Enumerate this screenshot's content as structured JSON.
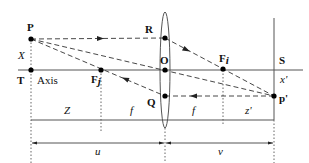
{
  "diagram": {
    "points": {
      "P": {
        "label": "P",
        "x": 31,
        "y": 39
      },
      "T": {
        "label": "T",
        "x": 31,
        "y": 70
      },
      "R": {
        "label": "R",
        "x": 165,
        "y": 38
      },
      "O": {
        "label": "O",
        "x": 165,
        "y": 70
      },
      "Q": {
        "label": "Q",
        "x": 165,
        "y": 96
      },
      "Fj": {
        "label": "F",
        "sub": "j",
        "x": 101,
        "y": 70
      },
      "Fi": {
        "label": "F",
        "sub": "i",
        "x": 223,
        "y": 70
      },
      "S": {
        "label": "S",
        "x": 274,
        "y": 70
      },
      "Pprime": {
        "label": "p'",
        "x": 274,
        "y": 96
      }
    },
    "labels": {
      "axis": "Axis",
      "X": "X",
      "xprime": "x'",
      "Z": "Z",
      "f_left": "f",
      "f_right": "f",
      "zprime": "z'",
      "u": "u",
      "v": "v"
    },
    "colors": {
      "line": "#555555",
      "ray": "#333333",
      "point": "#000000"
    }
  }
}
